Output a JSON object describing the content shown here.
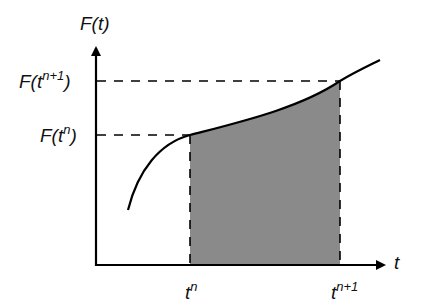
{
  "diagram": {
    "type": "function-integral-illustration",
    "y_axis_label": {
      "base": "F(t)"
    },
    "x_axis_label": {
      "base": "t"
    },
    "y_ticks": [
      {
        "prefix": "F(t",
        "sup": "n+1",
        "suffix": ")"
      },
      {
        "prefix": "F(t",
        "sup": "n",
        "suffix": ")"
      }
    ],
    "x_ticks": [
      {
        "base": "t",
        "sup": "n"
      },
      {
        "base": "t",
        "sup": "n+1"
      }
    ],
    "shaded_region": {
      "from": "t^n",
      "to": "t^(n+1)",
      "color": "#8a8a8a"
    },
    "curve_color": "#000000",
    "axis_color": "#000000"
  }
}
